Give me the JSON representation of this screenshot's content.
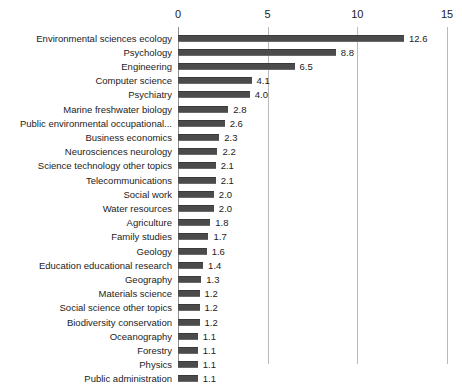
{
  "chart_data": {
    "type": "bar",
    "orientation": "horizontal",
    "title": "",
    "subtitle": "",
    "xlabel": "",
    "ylabel": "",
    "xlim": [
      0,
      15
    ],
    "xticks": [
      0,
      5,
      10,
      15
    ],
    "xtick_labels": [
      "0",
      "5",
      "10",
      "15"
    ],
    "grid": true,
    "axis_position": "top",
    "legend": null,
    "bar_color": "#4b4b4b",
    "gridline_color": "#b9b9be",
    "background_color": "#ffffff",
    "value_label_format": "one-decimal",
    "categories": [
      "Environmental sciences ecology",
      "Psychology",
      "Engineering",
      "Computer science",
      "Psychiatry",
      "Marine freshwater biology",
      "Public environmental occupational...",
      "Business economics",
      "Neurosciences neurology",
      "Science technology other topics",
      "Telecommunications",
      "Social work",
      "Water resources",
      "Agriculture",
      "Family studies",
      "Geology",
      "Education educational research",
      "Geography",
      "Materials science",
      "Social science other topics",
      "Biodiversity conservation",
      "Oceanography",
      "Forestry",
      "Physics",
      "Public administration"
    ],
    "values": [
      12.6,
      8.8,
      6.5,
      4.1,
      4.0,
      2.8,
      2.6,
      2.3,
      2.2,
      2.1,
      2.1,
      2.0,
      2.0,
      1.8,
      1.7,
      1.6,
      1.4,
      1.3,
      1.2,
      1.2,
      1.2,
      1.1,
      1.1,
      1.1,
      1.1
    ],
    "value_labels": [
      "12.6",
      "8.8",
      "6.5",
      "4.1",
      "4.0",
      "2.8",
      "2.6",
      "2.3",
      "2.2",
      "2.1",
      "2.1",
      "2.0",
      "2.0",
      "1.8",
      "1.7",
      "1.6",
      "1.4",
      "1.3",
      "1.2",
      "1.2",
      "1.2",
      "1.1",
      "1.1",
      "1.1",
      "1.1"
    ]
  }
}
